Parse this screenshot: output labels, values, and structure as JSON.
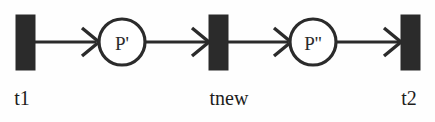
{
  "diagram": {
    "type": "petri-net",
    "background_color": "#fefefe",
    "ink_color": "#2b2b2b",
    "width": 435,
    "height": 122
  },
  "places": [
    {
      "id": "p-prime",
      "label": "P'",
      "cx": 122,
      "cy": 42,
      "r": 23
    },
    {
      "id": "p-double-prime",
      "label": "P''",
      "cx": 313,
      "cy": 42,
      "r": 23
    }
  ],
  "transitions": [
    {
      "id": "t1",
      "label": "t1",
      "x": 16,
      "y": 15,
      "width": 19,
      "height": 55,
      "label_x": 22,
      "label_y": 105
    },
    {
      "id": "tnew",
      "label": "tnew",
      "x": 209,
      "y": 15,
      "width": 19,
      "height": 55,
      "label_x": 229,
      "label_y": 105
    },
    {
      "id": "t2",
      "label": "t2",
      "x": 401,
      "y": 15,
      "width": 19,
      "height": 55,
      "label_x": 407,
      "label_y": 105
    }
  ],
  "arcs": [
    {
      "id": "arc-t1-to-p",
      "from": "t1",
      "to": "p-prime",
      "x1": 35,
      "x2": 99,
      "y": 42
    },
    {
      "id": "arc-p-to-tnew",
      "from": "p-prime",
      "to": "tnew",
      "x1": 145,
      "x2": 209,
      "y": 42
    },
    {
      "id": "arc-tnew-to-pp",
      "from": "tnew",
      "to": "p-double-prime",
      "x1": 228,
      "x2": 290,
      "y": 42
    },
    {
      "id": "arc-pp-to-t2",
      "from": "p-double-prime",
      "to": "t2",
      "x1": 336,
      "x2": 401,
      "y": 42
    }
  ]
}
